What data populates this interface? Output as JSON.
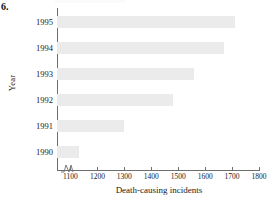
{
  "figure": {
    "number_label": "6."
  },
  "chart_data": {
    "type": "bar",
    "orientation": "horizontal",
    "title": "",
    "xlabel": "Death-causing incidents",
    "ylabel": "Year",
    "categories": [
      "1995",
      "1994",
      "1993",
      "1992",
      "1991",
      "1990"
    ],
    "values": [
      1710,
      1670,
      1560,
      1480,
      1300,
      1130
    ],
    "xlim": [
      1050,
      1800
    ],
    "axis_break": true,
    "xticks": [
      1100,
      1200,
      1300,
      1400,
      1500,
      1600,
      1700,
      1800
    ],
    "xtick_labels": [
      "1100",
      "1200",
      "1300",
      "1400",
      "1500",
      "1600",
      "1700",
      "1800"
    ],
    "grid": false,
    "legend": null,
    "bar_color": "#ebebeb",
    "axis_color": "#6e6e6e"
  }
}
